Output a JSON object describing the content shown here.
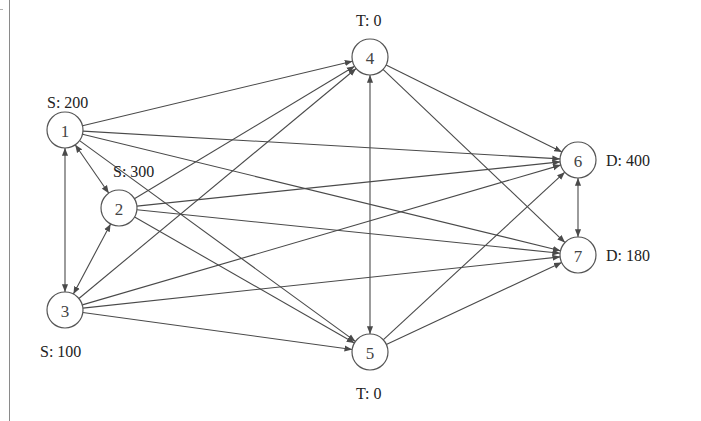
{
  "diagram": {
    "type": "network-flow",
    "colors": {
      "edge": "#4a4a4a",
      "node_stroke": "#555555",
      "text": "#222222",
      "background": "#ffffff"
    },
    "nodes": [
      {
        "id": "1",
        "label": "1",
        "x": 65,
        "y": 130,
        "annotation": "S: 200",
        "ann_x": 47,
        "ann_y": 108
      },
      {
        "id": "2",
        "label": "2",
        "x": 119,
        "y": 208,
        "annotation": "S: 300",
        "ann_x": 113,
        "ann_y": 177
      },
      {
        "id": "3",
        "label": "3",
        "x": 65,
        "y": 310,
        "annotation": "S: 100",
        "ann_x": 40,
        "ann_y": 357
      },
      {
        "id": "4",
        "label": "4",
        "x": 370,
        "y": 57,
        "annotation": "T: 0",
        "ann_x": 356,
        "ann_y": 26
      },
      {
        "id": "5",
        "label": "5",
        "x": 370,
        "y": 352,
        "annotation": "T: 0",
        "ann_x": 356,
        "ann_y": 399
      },
      {
        "id": "6",
        "label": "6",
        "x": 578,
        "y": 160,
        "annotation": "D: 400",
        "ann_x": 606,
        "ann_y": 166
      },
      {
        "id": "7",
        "label": "7",
        "x": 578,
        "y": 255,
        "annotation": "D: 180",
        "ann_x": 606,
        "ann_y": 261
      }
    ],
    "edges": [
      {
        "from": "1",
        "to": "2",
        "bidirectional": true
      },
      {
        "from": "1",
        "to": "3",
        "bidirectional": true
      },
      {
        "from": "2",
        "to": "3",
        "bidirectional": true
      },
      {
        "from": "4",
        "to": "5",
        "bidirectional": true
      },
      {
        "from": "6",
        "to": "7",
        "bidirectional": true
      },
      {
        "from": "1",
        "to": "4",
        "bidirectional": false
      },
      {
        "from": "1",
        "to": "5",
        "bidirectional": false
      },
      {
        "from": "1",
        "to": "6",
        "bidirectional": false
      },
      {
        "from": "1",
        "to": "7",
        "bidirectional": false
      },
      {
        "from": "2",
        "to": "4",
        "bidirectional": false
      },
      {
        "from": "2",
        "to": "5",
        "bidirectional": false
      },
      {
        "from": "2",
        "to": "6",
        "bidirectional": false
      },
      {
        "from": "2",
        "to": "7",
        "bidirectional": false
      },
      {
        "from": "3",
        "to": "4",
        "bidirectional": false
      },
      {
        "from": "3",
        "to": "5",
        "bidirectional": false
      },
      {
        "from": "3",
        "to": "6",
        "bidirectional": false
      },
      {
        "from": "3",
        "to": "7",
        "bidirectional": false
      },
      {
        "from": "4",
        "to": "6",
        "bidirectional": false
      },
      {
        "from": "4",
        "to": "7",
        "bidirectional": false
      },
      {
        "from": "5",
        "to": "6",
        "bidirectional": false
      },
      {
        "from": "5",
        "to": "7",
        "bidirectional": false
      }
    ],
    "node_radius": 18
  }
}
